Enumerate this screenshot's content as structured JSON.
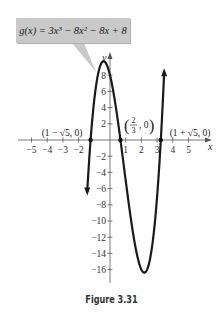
{
  "chart_data": {
    "type": "line",
    "title": "",
    "function_label": "g(x) = 3x³ − 8x² − 8x + 8",
    "function": {
      "name": "g",
      "coefficients": [
        3,
        -8,
        -8,
        8
      ]
    },
    "xlabel": "x",
    "ylabel": "y",
    "xlim": [
      -6,
      7
    ],
    "ylim": [
      -18,
      10
    ],
    "x_ticks": [
      -5,
      -4,
      -3,
      -2,
      1,
      2,
      3,
      4,
      5
    ],
    "x_tick_labels": [
      "−5",
      "−4",
      "−3",
      "−2",
      "1",
      "2",
      "3",
      "4",
      "5"
    ],
    "y_ticks": [
      8,
      6,
      4,
      2,
      -2,
      -4,
      -6,
      -8,
      -10,
      -12,
      -14,
      -16
    ],
    "y_tick_labels": [
      "8",
      "6",
      "4",
      "2",
      "−2",
      "−4",
      "−6",
      "−8",
      "−10",
      "−12",
      "−14",
      "−16"
    ],
    "grid": false,
    "x_domain_plotted": [
      -1.45,
      3.45
    ],
    "points": [
      {
        "x": -1.236,
        "y": 0,
        "label": "(1 − √5, 0)"
      },
      {
        "x": 0.667,
        "y": 0,
        "label": "(2/3, 0)"
      },
      {
        "x": 3.236,
        "y": 0,
        "label": "(1 + √5, 0)"
      }
    ],
    "local_max": {
      "x": -0.41,
      "y": 9.7
    },
    "local_min": {
      "x": 2.19,
      "y": -16.3
    }
  },
  "figure": {
    "callout_text": "g(x) = 3x³ − 8x² − 8x + 8",
    "caption": "Figure 3.31",
    "point_labels": {
      "left": "(1 − √5, 0)",
      "middle_num": "2",
      "middle_den": "3",
      "right": "(1 + √5, 0)"
    },
    "colors": {
      "curve": "#1a1a1a",
      "axis": "#555555",
      "callout_bg": "#c9c9c9"
    }
  }
}
